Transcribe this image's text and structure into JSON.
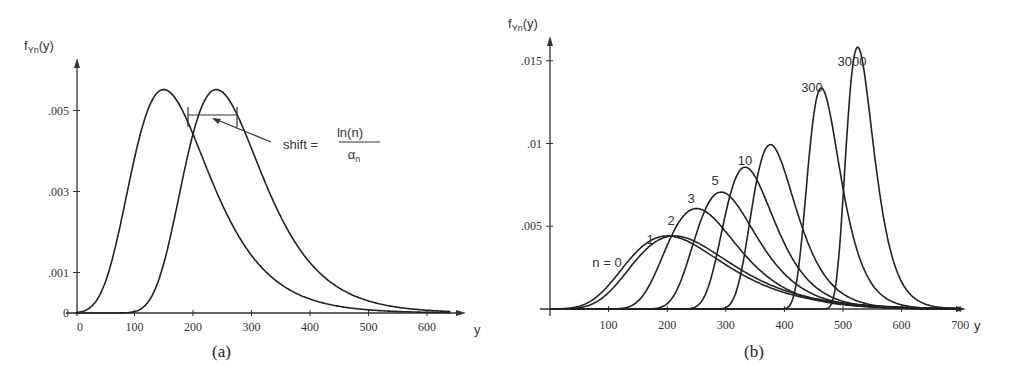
{
  "chart_data": [
    {
      "type": "line",
      "panel": "(a)",
      "ylabel": "f_Yn(y)",
      "xlabel": "y",
      "x_ticks": [
        0,
        100,
        200,
        300,
        400,
        500,
        600
      ],
      "y_ticks": [
        "0",
        ".001",
        ".003",
        ".005"
      ],
      "y_tick_values": [
        0,
        0.001,
        0.003,
        0.005
      ],
      "xlim": [
        0,
        650
      ],
      "ylim": [
        0,
        0.0065
      ],
      "annotation": {
        "text": "shift =",
        "numerator": "ln(n)",
        "denominator": "α",
        "denominator_sub": "n"
      },
      "series": [
        {
          "name": "original",
          "distribution": "gumbel",
          "alpha": 0.015,
          "mode": 150,
          "peak": 0.0055
        },
        {
          "name": "shifted",
          "distribution": "gumbel",
          "alpha": 0.015,
          "mode": 240,
          "peak": 0.0055
        }
      ]
    },
    {
      "type": "line",
      "panel": "(b)",
      "ylabel": "f_Yn(y)",
      "xlabel": "y",
      "x_ticks": [
        100,
        200,
        300,
        400,
        500,
        600,
        700
      ],
      "y_ticks": [
        ".005",
        ".01",
        ".015"
      ],
      "y_tick_values": [
        0.005,
        0.01,
        0.015
      ],
      "xlim": [
        0,
        720
      ],
      "ylim": [
        0,
        0.0165
      ],
      "series": [
        {
          "name": "n = 0",
          "label": "n = 0",
          "alpha": 0.012,
          "mode": 200,
          "peak": 0.0044
        },
        {
          "name": "n = 1",
          "label": "1",
          "alpha": 0.012,
          "mode": 212,
          "peak": 0.0044
        },
        {
          "name": "n = 2",
          "label": "2",
          "alpha": 0.0165,
          "mode": 250,
          "peak": 0.006
        },
        {
          "name": "n = 3",
          "label": "3",
          "alpha": 0.0192,
          "mode": 292,
          "peak": 0.0071
        },
        {
          "name": "n = 5",
          "label": "5",
          "alpha": 0.0233,
          "mode": 333,
          "peak": 0.0086
        },
        {
          "name": "n = 10",
          "label": "10",
          "alpha": 0.027,
          "mode": 376,
          "peak": 0.0099
        },
        {
          "name": "n = 300",
          "label": "300",
          "alpha": 0.0363,
          "mode": 463,
          "peak": 0.0134
        },
        {
          "name": "n = 3000",
          "label": "3000",
          "alpha": 0.043,
          "mode": 525,
          "peak": 0.0158
        }
      ]
    }
  ],
  "captions": {
    "a": "(a)",
    "b": "(b)"
  },
  "axis_labels": {
    "a": {
      "y_main": "f",
      "y_sub": "Yn",
      "y_arg": "(y)",
      "x": "y"
    },
    "b": {
      "y_main": "f",
      "y_sub": "Yn",
      "y_arg": "(y)",
      "x": "y"
    }
  },
  "annotation_a": {
    "prefix": "shift =",
    "numerator": "ln(n)",
    "denominator": "α",
    "denominator_sub": "n"
  },
  "labels_b": [
    "n = 0",
    "1",
    "2",
    "3",
    "5",
    "10",
    "300",
    "3000"
  ]
}
